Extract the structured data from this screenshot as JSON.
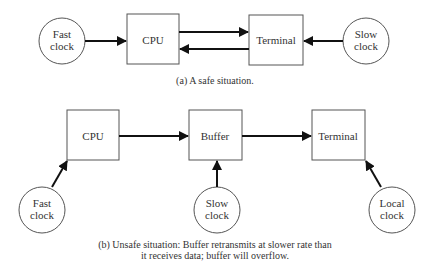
{
  "diagram_a": {
    "nodes": {
      "fast_clock": {
        "line1": "Fast",
        "line2": "clock"
      },
      "cpu": {
        "label": "CPU"
      },
      "terminal": {
        "label": "Terminal"
      },
      "slow_clock": {
        "line1": "Slow",
        "line2": "clock"
      }
    },
    "edges": [
      {
        "from": "Fast clock",
        "to": "CPU"
      },
      {
        "from": "CPU",
        "to": "Terminal"
      },
      {
        "from": "Terminal",
        "to": "CPU"
      },
      {
        "from": "Slow clock",
        "to": "Terminal"
      }
    ],
    "caption": "(a) A safe situation."
  },
  "diagram_b": {
    "nodes": {
      "cpu": {
        "label": "CPU"
      },
      "buffer": {
        "label": "Buffer"
      },
      "terminal": {
        "label": "Terminal"
      },
      "fast_clock": {
        "line1": "Fast",
        "line2": "clock"
      },
      "slow_clock": {
        "line1": "Slow",
        "line2": "clock"
      },
      "local_clock": {
        "line1": "Local",
        "line2": "clock"
      }
    },
    "edges": [
      {
        "from": "CPU",
        "to": "Buffer"
      },
      {
        "from": "Buffer",
        "to": "Terminal"
      },
      {
        "from": "Fast clock",
        "to": "CPU"
      },
      {
        "from": "Slow clock",
        "to": "Buffer"
      },
      {
        "from": "Local clock",
        "to": "Terminal"
      }
    ],
    "caption_line1": "(b) Unsafe situation: Buffer retransmits at slower rate than",
    "caption_line2": "it receives data; buffer will overflow."
  }
}
